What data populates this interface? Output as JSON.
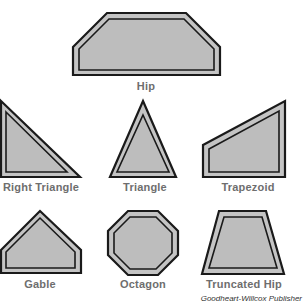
{
  "figure": {
    "credit": "Goodheart-Willcox Publisher",
    "colors": {
      "fill": "#c4c4c4",
      "outline": "#1a1a1a",
      "label": "#6e6e6e"
    },
    "shapes": [
      {
        "name": "hip",
        "label": "Hip"
      },
      {
        "name": "right-triangle",
        "label": "Right Triangle"
      },
      {
        "name": "triangle",
        "label": "Triangle"
      },
      {
        "name": "trapezoid",
        "label": "Trapezoid"
      },
      {
        "name": "gable",
        "label": "Gable"
      },
      {
        "name": "octagon",
        "label": "Octagon"
      },
      {
        "name": "truncated-hip",
        "label": "Truncated Hip"
      }
    ]
  }
}
